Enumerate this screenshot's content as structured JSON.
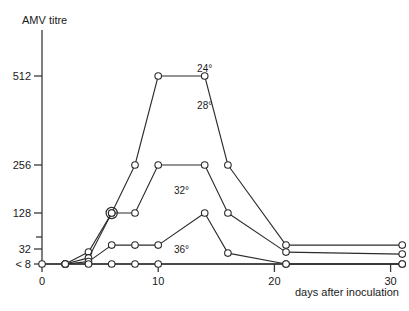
{
  "chart_data": {
    "type": "line",
    "title": "",
    "ylabel": "AMV titre",
    "xlabel": "days after inoculation",
    "y_scale": "log2",
    "y_ticks": [
      {
        "label": "512",
        "value": 512,
        "labeled": true
      },
      {
        "label": "256",
        "value": 256,
        "labeled": true
      },
      {
        "label": "128",
        "value": 128,
        "labeled": true
      },
      {
        "label": "64",
        "value": 64,
        "labeled": false
      },
      {
        "label": "32",
        "value": 32,
        "labeled": true
      },
      {
        "label": "< 8",
        "value": 8,
        "labeled": true
      }
    ],
    "x_ticks": [
      {
        "label": "0",
        "value": 0
      },
      {
        "label": "10",
        "value": 10
      },
      {
        "label": "20",
        "value": 20
      },
      {
        "label": "30",
        "value": 30
      }
    ],
    "xlim": [
      0,
      32
    ],
    "grid": false,
    "legend_position": "inline-annotations",
    "series": [
      {
        "name": "24°",
        "label": "24°",
        "label_x": 14,
        "label_y": 1024,
        "points": [
          {
            "x": 2,
            "y": 8
          },
          {
            "x": 4,
            "y": 24
          },
          {
            "x": 6,
            "y": 128
          },
          {
            "x": 8,
            "y": 256
          },
          {
            "x": 10,
            "y": 512
          },
          {
            "x": 14,
            "y": 512
          },
          {
            "x": 16,
            "y": 256
          },
          {
            "x": 21,
            "y": 40
          },
          {
            "x": 31,
            "y": 40
          }
        ],
        "special_markers": [
          {
            "x": 6,
            "y": 128,
            "style": "double-circle"
          }
        ]
      },
      {
        "name": "28°",
        "label": "28°",
        "label_x": 14,
        "label_y": 384,
        "points": [
          {
            "x": 2,
            "y": 8
          },
          {
            "x": 4,
            "y": 14
          },
          {
            "x": 6,
            "y": 128
          },
          {
            "x": 8,
            "y": 128
          },
          {
            "x": 10,
            "y": 256
          },
          {
            "x": 14,
            "y": 256
          },
          {
            "x": 16,
            "y": 128
          },
          {
            "x": 21,
            "y": 24
          },
          {
            "x": 31,
            "y": 20
          }
        ],
        "special_markers": []
      },
      {
        "name": "32°",
        "label": "32°",
        "label_x": 12,
        "label_y": 160,
        "points": [
          {
            "x": 2,
            "y": 8
          },
          {
            "x": 4,
            "y": 10
          },
          {
            "x": 6,
            "y": 40
          },
          {
            "x": 8,
            "y": 40
          },
          {
            "x": 10,
            "y": 40
          },
          {
            "x": 14,
            "y": 128
          },
          {
            "x": 16,
            "y": 22
          },
          {
            "x": 21,
            "y": 8
          },
          {
            "x": 31,
            "y": 8
          }
        ],
        "special_markers": []
      },
      {
        "name": "36°",
        "label": "36°",
        "label_x": 12,
        "label_y": 16,
        "points": [
          {
            "x": 0,
            "y": 8
          },
          {
            "x": 2,
            "y": 8
          },
          {
            "x": 4,
            "y": 8
          },
          {
            "x": 6,
            "y": 8
          },
          {
            "x": 8,
            "y": 8
          },
          {
            "x": 10,
            "y": 8
          },
          {
            "x": 21,
            "y": 8
          },
          {
            "x": 31,
            "y": 8
          }
        ],
        "special_markers": []
      }
    ]
  },
  "colors": {
    "background": "#ffffff",
    "axis": "#3a3a3a",
    "line": "#2b2b2b",
    "marker_fill": "#ffffff",
    "text": "#1a1a1a"
  }
}
